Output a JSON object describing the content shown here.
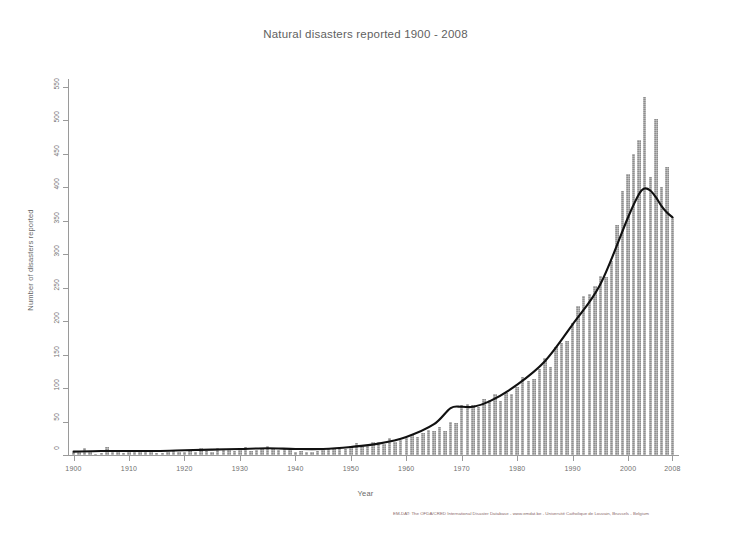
{
  "chart_data": {
    "type": "bar",
    "title": "Natural disasters reported 1900 - 2008",
    "xlabel": "Year",
    "ylabel": "Number of disasters reported",
    "xlim": [
      1899,
      2009
    ],
    "ylim": [
      0,
      560
    ],
    "yticks": [
      0,
      50,
      100,
      150,
      200,
      250,
      300,
      350,
      400,
      450,
      500,
      550
    ],
    "xticks": [
      1900,
      1910,
      1920,
      1930,
      1940,
      1950,
      1960,
      1970,
      1980,
      1990,
      2000,
      2008
    ],
    "grid": false,
    "legend": null,
    "bar_color": "#8e8e8e",
    "trend_color": "#000000",
    "series": [
      {
        "name": "Number of disasters reported",
        "categories": [
          1900,
          1901,
          1902,
          1903,
          1904,
          1905,
          1906,
          1907,
          1908,
          1909,
          1910,
          1911,
          1912,
          1913,
          1914,
          1915,
          1916,
          1917,
          1918,
          1919,
          1920,
          1921,
          1922,
          1923,
          1924,
          1925,
          1926,
          1927,
          1928,
          1929,
          1930,
          1931,
          1932,
          1933,
          1934,
          1935,
          1936,
          1937,
          1938,
          1939,
          1940,
          1941,
          1942,
          1943,
          1944,
          1945,
          1946,
          1947,
          1948,
          1949,
          1950,
          1951,
          1952,
          1953,
          1954,
          1955,
          1956,
          1957,
          1958,
          1959,
          1960,
          1961,
          1962,
          1963,
          1964,
          1965,
          1966,
          1967,
          1968,
          1969,
          1970,
          1971,
          1972,
          1973,
          1974,
          1975,
          1976,
          1977,
          1978,
          1979,
          1980,
          1981,
          1982,
          1983,
          1984,
          1985,
          1986,
          1987,
          1988,
          1989,
          1990,
          1991,
          1992,
          1993,
          1994,
          1995,
          1996,
          1997,
          1998,
          1999,
          2000,
          2001,
          2002,
          2003,
          2004,
          2005,
          2006,
          2007,
          2008
        ],
        "values": [
          4,
          4,
          10,
          5,
          2,
          3,
          12,
          6,
          5,
          3,
          7,
          4,
          6,
          6,
          4,
          3,
          3,
          5,
          7,
          4,
          5,
          6,
          4,
          10,
          6,
          5,
          10,
          9,
          7,
          6,
          9,
          12,
          6,
          7,
          9,
          14,
          10,
          8,
          9,
          7,
          5,
          6,
          5,
          5,
          6,
          7,
          10,
          9,
          11,
          9,
          14,
          18,
          15,
          14,
          20,
          20,
          16,
          25,
          20,
          22,
          26,
          30,
          27,
          33,
          38,
          36,
          42,
          36,
          50,
          48,
          74,
          76,
          75,
          72,
          83,
          82,
          91,
          80,
          92,
          91,
          102,
          117,
          110,
          113,
          128,
          145,
          132,
          162,
          168,
          170,
          197,
          222,
          238,
          240,
          252,
          268,
          266,
          289,
          344,
          394,
          420,
          450,
          470,
          535,
          415,
          502,
          400,
          430,
          355
        ]
      }
    ],
    "trend": {
      "name": "LOESS smoothed trend",
      "x": [
        1900,
        1905,
        1910,
        1915,
        1920,
        1925,
        1930,
        1935,
        1940,
        1945,
        1950,
        1955,
        1960,
        1965,
        1968,
        1970,
        1972,
        1975,
        1980,
        1985,
        1990,
        1995,
        2000,
        2002,
        2003,
        2004,
        2005,
        2006,
        2007,
        2008
      ],
      "y": [
        5,
        6,
        6,
        6,
        7,
        8,
        9,
        10,
        9,
        9,
        12,
        17,
        27,
        46,
        70,
        72,
        72,
        80,
        105,
        140,
        195,
        255,
        355,
        390,
        398,
        395,
        385,
        372,
        362,
        355
      ]
    }
  },
  "footer": {
    "source": "EM-DAT: The OFDA/CRED International Disaster Database - www.emdat.be - Université Catholique de Louvain, Brussels - Belgium"
  }
}
